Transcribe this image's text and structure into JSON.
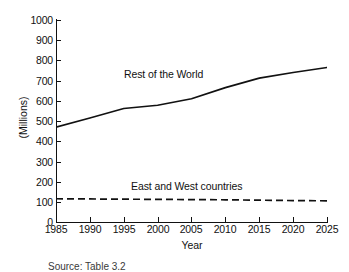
{
  "chart_data": {
    "type": "line",
    "title": "",
    "xlabel": "Year",
    "ylabel": "(Millions)",
    "xlim": [
      1985,
      2025
    ],
    "ylim": [
      0,
      1000
    ],
    "grid": false,
    "legend_position": "inline-annotation",
    "x": [
      1985,
      1990,
      1995,
      2000,
      2005,
      2010,
      2015,
      2020,
      2025
    ],
    "xticks": [
      "1985",
      "1990",
      "1995",
      "2000",
      "2005",
      "2010",
      "2015",
      "2020",
      "2025"
    ],
    "yticks": [
      "0",
      "100",
      "200",
      "300",
      "400",
      "500",
      "600",
      "700",
      "800",
      "900",
      "1000"
    ],
    "series": [
      {
        "name": "Rest of the World",
        "style": "solid",
        "color": "#111111",
        "values": [
          470,
          515,
          562,
          578,
          610,
          665,
          712,
          740,
          765
        ]
      },
      {
        "name": "East and West countries",
        "style": "dashed",
        "color": "#111111",
        "values": [
          115,
          114,
          113,
          112,
          111,
          110,
          108,
          106,
          105
        ]
      }
    ],
    "annotations": [
      {
        "text": "Rest of the World",
        "x": 2001,
        "y": 740
      },
      {
        "text": "East and West countries",
        "x": 2002,
        "y": 205
      }
    ]
  },
  "axes": {
    "y_title": "(Millions)",
    "x_title": "Year"
  },
  "caption": {
    "source_text": "Source: Table 3.2"
  }
}
